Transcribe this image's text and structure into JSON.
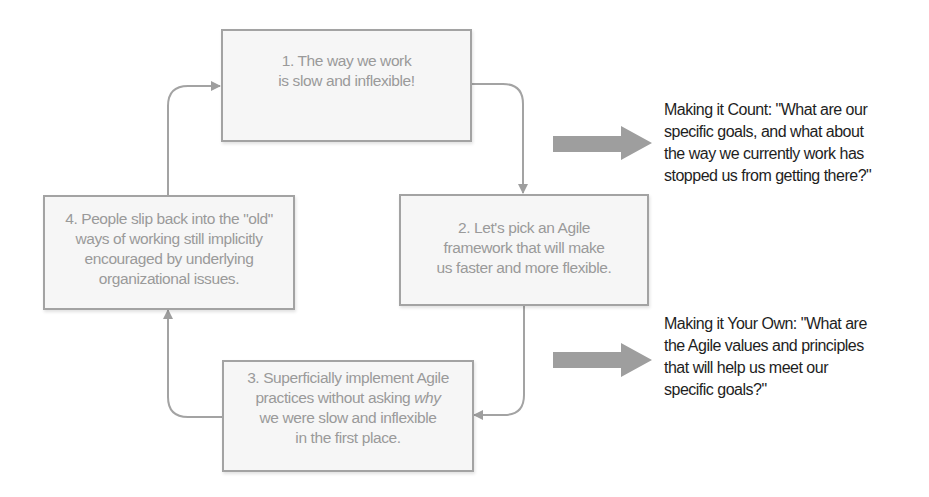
{
  "diagram": {
    "boxes": [
      {
        "id": 1,
        "lines": [
          "1. The way we work",
          "is slow and inflexible!"
        ]
      },
      {
        "id": 2,
        "lines": [
          "2. Let's pick an Agile",
          "framework that will make",
          "us faster and more flexible."
        ]
      },
      {
        "id": 3,
        "lines": [
          "3. Superficially implement Agile",
          "practices without asking ",
          "we were slow and inflexible",
          "in the first place."
        ],
        "emphasis": "why"
      },
      {
        "id": 4,
        "lines": [
          "4. People slip back into the \"old\"",
          "ways of working still implicitly",
          "encouraged by underlying",
          "organizational issues."
        ]
      }
    ],
    "notes": [
      {
        "lines": [
          "Making it Count: \"What are our",
          "specific goals, and what about",
          "the way we currently work has",
          "stopped us from getting there?\""
        ]
      },
      {
        "lines": [
          "Making it Your Own: \"What are",
          "the Agile values and principles",
          "that will help us meet our",
          "specific goals?\""
        ]
      }
    ],
    "colors": {
      "box_border": "#a3a3a3",
      "box_fill": "#f6f6f6",
      "box_text": "#9a9a9a",
      "arrow": "#9e9e9e",
      "note_text": "#1e1e1e"
    }
  }
}
